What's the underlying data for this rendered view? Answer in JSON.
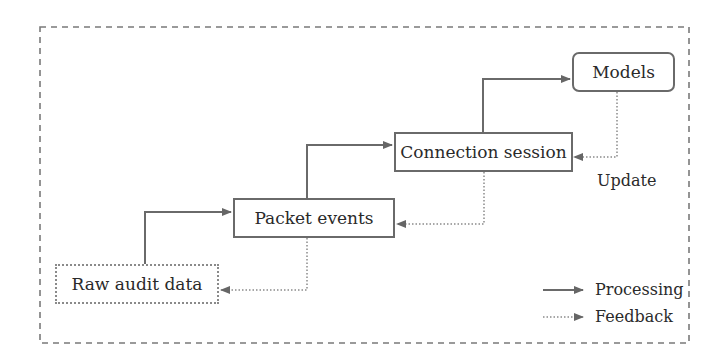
{
  "diagram": {
    "nodes": [
      {
        "id": "raw",
        "label": "Raw audit data",
        "style": "dotted"
      },
      {
        "id": "packet",
        "label": "Packet events",
        "style": "solid"
      },
      {
        "id": "connection",
        "label": "Connection session",
        "style": "solid"
      },
      {
        "id": "models",
        "label": "Models",
        "style": "rounded"
      }
    ],
    "edges": [
      {
        "from": "raw",
        "to": "packet",
        "type": "processing"
      },
      {
        "from": "packet",
        "to": "connection",
        "type": "processing"
      },
      {
        "from": "connection",
        "to": "models",
        "type": "processing"
      },
      {
        "from": "models",
        "to": "connection",
        "type": "feedback",
        "label": "Update"
      },
      {
        "from": "connection",
        "to": "packet",
        "type": "feedback"
      },
      {
        "from": "packet",
        "to": "raw",
        "type": "feedback"
      }
    ],
    "update_label": "Update"
  },
  "legend": {
    "items": [
      {
        "label": "Processing",
        "style": "solid-arrow"
      },
      {
        "label": "Feedback",
        "style": "dotted-arrow"
      }
    ]
  },
  "colors": {
    "line": "#6a6a6a",
    "dotted": "#8a8a8a",
    "text": "#2a2a2a"
  }
}
